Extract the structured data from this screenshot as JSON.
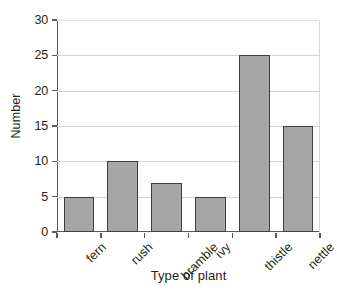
{
  "chart_data": {
    "type": "bar",
    "title": "",
    "subtitle": "",
    "xlabel": "Type of plant",
    "ylabel": "Number",
    "categories": [
      "fern",
      "rush",
      "bramble",
      "ivy",
      "thistle",
      "nettle"
    ],
    "values": [
      5,
      10,
      7,
      5,
      25,
      15
    ],
    "series": [
      {
        "name": "Number",
        "values": [
          5,
          10,
          7,
          5,
          25,
          15
        ]
      }
    ],
    "ylim": [
      0,
      30
    ],
    "ytick_labels": [
      "0",
      "5",
      "10",
      "15",
      "20",
      "25",
      "30"
    ],
    "ytick_values": [
      0,
      5,
      10,
      15,
      20,
      25,
      30
    ],
    "grid": true,
    "grid_axis": "y",
    "legend": false,
    "legend_position": "none",
    "bar_fill_color": "#a6a6a6",
    "bar_edge_color": "#3f3f3f",
    "gridline_color": "#d4d4d4",
    "axis_color": "#58595b",
    "text_color": "#231f20",
    "background_color": "#ffffff",
    "xtick_label_rotation": -45
  }
}
